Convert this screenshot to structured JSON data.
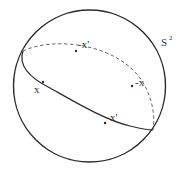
{
  "figure": {
    "sphere_label": "S",
    "sphere_label_sup": "2",
    "colors": {
      "stroke": "#2a2a2a",
      "text": "#333333",
      "background": "#ffffff"
    },
    "sphere": {
      "cx": 89.5,
      "cy": 86,
      "r": 76
    },
    "great_circle": {
      "front_style": "solid",
      "back_style": "dashed"
    },
    "points": [
      {
        "id": "x",
        "label": "x",
        "x": 43,
        "y": 82,
        "side": "front"
      },
      {
        "id": "x-prime",
        "label": "x'",
        "x": 105,
        "y": 123,
        "side": "front"
      },
      {
        "id": "neg-x",
        "label": "-x",
        "x": 132,
        "y": 86,
        "side": "back"
      },
      {
        "id": "neg-x-prime",
        "label": "-x'",
        "x": 76,
        "y": 51,
        "side": "back"
      }
    ]
  }
}
